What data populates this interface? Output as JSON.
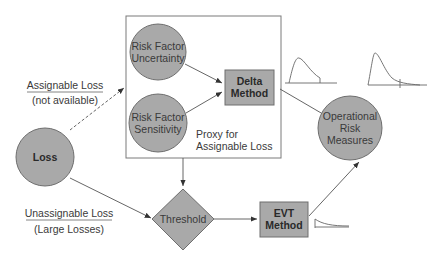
{
  "nodes": {
    "loss": {
      "label": "Loss"
    },
    "risk_factor_uncertainty": {
      "line1": "Risk Factor",
      "line2": "Uncertainty"
    },
    "risk_factor_sensitivity": {
      "line1": "Risk Factor",
      "line2": "Sensitivity"
    },
    "delta_method": {
      "line1": "Delta",
      "line2": "Method"
    },
    "threshold": {
      "label": "Threshold"
    },
    "evt_method": {
      "line1": "EVT",
      "line2": "Method"
    },
    "operational_risk_measures": {
      "line1": "Operational",
      "line2": "Risk",
      "line3": "Measures"
    }
  },
  "group": {
    "proxy_box": {
      "line1": "Proxy for",
      "line2": "Assignable Loss"
    }
  },
  "edge_labels": {
    "assignable": {
      "line1": "Assignable Loss",
      "line2": "(not available)"
    },
    "unassignable": {
      "line1": "Unassignable Loss",
      "line2": "(Large Losses)"
    }
  },
  "colors": {
    "node_fill": "#a9a9a9",
    "node_stroke": "#6e6e6e",
    "line": "#555555",
    "background": "#ffffff"
  }
}
